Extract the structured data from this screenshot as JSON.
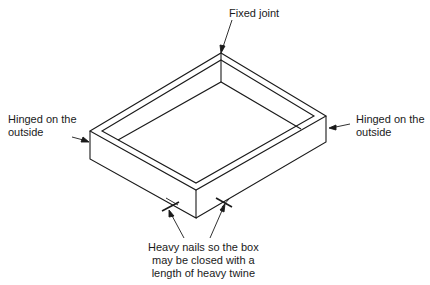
{
  "diagram": {
    "labels": {
      "fixed_joint": "Fixed joint",
      "hinged_left": "Hinged on the\noutside",
      "hinged_right": "Hinged on the\noutside",
      "nails": "Heavy nails so the box\nmay be closed with a\nlength of heavy twine"
    },
    "colors": {
      "stroke": "#1a1a1a",
      "background": "#ffffff"
    }
  }
}
